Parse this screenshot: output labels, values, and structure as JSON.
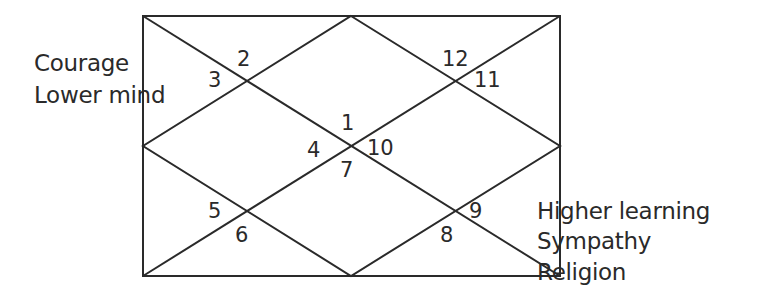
{
  "chart": {
    "style": "North Indian birth chart",
    "frame": {
      "x": 143,
      "y": 16,
      "width": 417,
      "height": 260
    },
    "line_color": "#2a2a2a",
    "houses": [
      {
        "number": "1",
        "x": 341,
        "y": 113
      },
      {
        "number": "2",
        "x": 237,
        "y": 49
      },
      {
        "number": "3",
        "x": 208,
        "y": 70
      },
      {
        "number": "4",
        "x": 307,
        "y": 140
      },
      {
        "number": "5",
        "x": 208,
        "y": 201
      },
      {
        "number": "6",
        "x": 235,
        "y": 225
      },
      {
        "number": "7",
        "x": 340,
        "y": 160
      },
      {
        "number": "8",
        "x": 440,
        "y": 225
      },
      {
        "number": "9",
        "x": 469,
        "y": 201
      },
      {
        "number": "10",
        "x": 367,
        "y": 138
      },
      {
        "number": "11",
        "x": 474,
        "y": 70
      },
      {
        "number": "12",
        "x": 442,
        "y": 49
      }
    ],
    "annotations": {
      "left": [
        "Courage",
        "Lower mind"
      ],
      "right": [
        "Higher learning",
        "Sympathy",
        "Religion"
      ]
    }
  }
}
